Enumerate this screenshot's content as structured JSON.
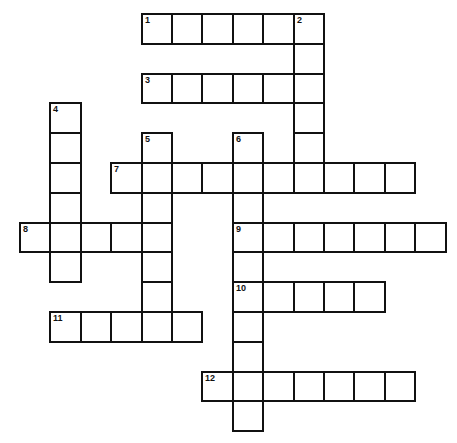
{
  "puzzle": {
    "grid": {
      "origin_x": 20,
      "origin_y": 14,
      "cell_w": 30.4,
      "cell_h": 29.8,
      "border_color": "#111111",
      "cell_color": "#ffffff"
    },
    "entries": [
      {
        "number": "1",
        "direction": "across",
        "row": 0,
        "col": 4,
        "length": 6
      },
      {
        "number": "2",
        "direction": "down",
        "row": 0,
        "col": 9,
        "length": 6
      },
      {
        "number": "3",
        "direction": "across",
        "row": 2,
        "col": 4,
        "length": 6
      },
      {
        "number": "4",
        "direction": "down",
        "row": 3,
        "col": 1,
        "length": 6
      },
      {
        "number": "5",
        "direction": "down",
        "row": 4,
        "col": 4,
        "length": 7
      },
      {
        "number": "6",
        "direction": "down",
        "row": 4,
        "col": 7,
        "length": 10
      },
      {
        "number": "7",
        "direction": "across",
        "row": 5,
        "col": 3,
        "length": 10
      },
      {
        "number": "8",
        "direction": "across",
        "row": 7,
        "col": 0,
        "length": 5
      },
      {
        "number": "9",
        "direction": "across",
        "row": 7,
        "col": 7,
        "length": 7
      },
      {
        "number": "10",
        "direction": "across",
        "row": 9,
        "col": 7,
        "length": 5
      },
      {
        "number": "11",
        "direction": "across",
        "row": 10,
        "col": 1,
        "length": 5
      },
      {
        "number": "12",
        "direction": "across",
        "row": 12,
        "col": 6,
        "length": 7
      }
    ]
  }
}
